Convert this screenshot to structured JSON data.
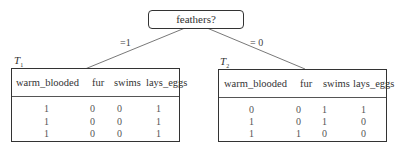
{
  "root": {
    "label": "feathers?"
  },
  "edges": [
    {
      "label": "=1"
    },
    {
      "label": "= 0"
    }
  ],
  "tables": [
    {
      "name": "T",
      "subscript": "1",
      "columns": [
        "warm_blooded",
        "fur",
        "swims",
        "lays_eggs"
      ],
      "rows": [
        [
          "1",
          "0",
          "0",
          "1"
        ],
        [
          "1",
          "0",
          "0",
          "1"
        ],
        [
          "1",
          "0",
          "0",
          "1"
        ]
      ]
    },
    {
      "name": "T",
      "subscript": "2",
      "columns": [
        "warm_blooded",
        "fur",
        "swims",
        "lays_eggs"
      ],
      "rows": [
        [
          "0",
          "0",
          "1",
          "1"
        ],
        [
          "1",
          "0",
          "1",
          "0"
        ],
        [
          "1",
          "1",
          "0",
          "0"
        ]
      ]
    }
  ]
}
